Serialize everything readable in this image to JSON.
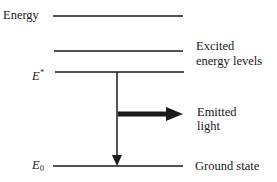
{
  "diagram": {
    "axis_label": "Energy",
    "levels": [
      {
        "name": "top-level",
        "symbol": "",
        "label": ""
      },
      {
        "name": "excited-level-1",
        "symbol": "",
        "label": "Excited energy levels"
      },
      {
        "name": "excited-state",
        "symbol": "E*",
        "label": ""
      },
      {
        "name": "ground-state",
        "symbol": "E0",
        "label": "Ground state"
      }
    ],
    "excited_label_line1": "Excited",
    "excited_label_line2": "energy levels",
    "estar_symbol": "E",
    "estar_sup": "*",
    "e0_symbol": "E",
    "e0_sub": "0",
    "ground_label": "Ground state",
    "emitted_line1": "Emitted",
    "emitted_line2": "light",
    "transition": {
      "from": "E*",
      "to": "E0"
    }
  }
}
